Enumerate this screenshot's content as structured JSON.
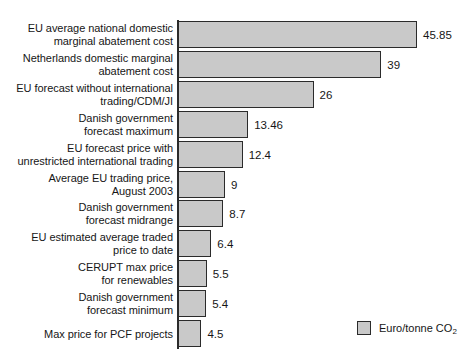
{
  "chart_data": {
    "type": "bar",
    "orientation": "horizontal",
    "title": "",
    "xlabel": "",
    "ylabel": "",
    "grid": false,
    "axis_line": true,
    "xlim": [
      0,
      45.85
    ],
    "legend": {
      "position": "bottom-right",
      "entries": [
        {
          "label": "Euro/tonne CO",
          "subscript": "2",
          "color": "#c9c9c9"
        }
      ]
    },
    "categories": [
      "EU average national domestic\nmarginal abatement cost",
      "Netherlands domestic marginal\nabatement cost",
      "EU forecast without international\ntrading/CDM/JI",
      "Danish government\nforecast maximum",
      "EU forecast price with\nunrestricted international trading",
      "Average EU trading price,\nAugust 2003",
      "Danish government\nforecast midrange",
      "EU estimated average traded\nprice to date",
      "CERUPT max price\nfor renewables",
      "Danish government\nforecast minimum",
      "Max price for PCF projects"
    ],
    "values": [
      45.85,
      39,
      26,
      13.46,
      12.4,
      9,
      8.7,
      6.4,
      5.5,
      5.4,
      4.5
    ],
    "value_labels": [
      "45.85",
      "39",
      "26",
      "13.46",
      "12.4",
      "9",
      "8.7",
      "6.4",
      "5.5",
      "5.4",
      "4.5"
    ],
    "colors": {
      "bar_fill": "#c9c9c9",
      "bar_border": "#2b2b2b",
      "text": "#161616"
    }
  }
}
